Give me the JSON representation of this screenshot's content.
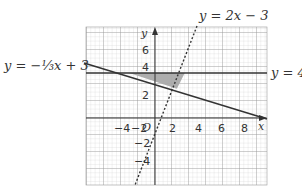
{
  "figure": {
    "labels": {
      "line_a": "y = −⅓x + 3",
      "line_b": "y = 2x − 3",
      "line_c": "y = 4",
      "x_axis": "x",
      "y_axis": "y",
      "origin": "O"
    },
    "x_ticks": [
      "−4",
      "−2",
      "2",
      "4",
      "6",
      "8"
    ],
    "y_ticks": [
      "6",
      "4",
      "2",
      "−2",
      "−4"
    ],
    "colors": {
      "grid_minor": "#c8c8c8",
      "grid_major": "#8a8a8a",
      "line": "#333333",
      "shade": "#a8a8a8"
    }
  }
}
